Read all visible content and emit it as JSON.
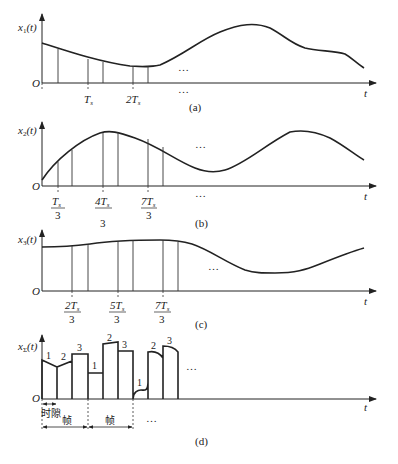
{
  "figure": {
    "panels": [
      {
        "id": "a",
        "caption": "(a)",
        "ylabel": "x1(t)",
        "ylabel_main": "x",
        "ylabel_sub": "1",
        "ylabel_arg": "(t)",
        "xlabel": "t",
        "origin": "O",
        "ticks": [
          {
            "label": "T",
            "sub": "s"
          },
          {
            "label": "2T",
            "sub": "s"
          }
        ],
        "ellipsis_upper": "…",
        "ellipsis_lower": "…"
      },
      {
        "id": "b",
        "caption": "(b)",
        "ylabel_main": "x",
        "ylabel_sub": "2",
        "ylabel_arg": "(t)",
        "xlabel": "t",
        "origin": "O",
        "ticks": [
          {
            "num": "T",
            "sub": "s",
            "den": "3"
          },
          {
            "num": "4T",
            "sub": "s",
            "den": "3"
          },
          {
            "num": "7T",
            "sub": "s",
            "den": "3"
          }
        ],
        "ellipsis_upper": "…",
        "ellipsis_lower": "…"
      },
      {
        "id": "c",
        "caption": "(c)",
        "ylabel_main": "x",
        "ylabel_sub": "3",
        "ylabel_arg": "(t)",
        "xlabel": "t",
        "origin": "O",
        "ticks": [
          {
            "num": "2T",
            "sub": "s",
            "den": "3"
          },
          {
            "num": "5T",
            "sub": "s",
            "den": "3"
          },
          {
            "num": "7T",
            "sub": "s",
            "den": "3"
          }
        ],
        "ellipsis_upper": "…"
      },
      {
        "id": "d",
        "caption": "(d)",
        "ylabel_main": "x",
        "ylabel_sub": "Σ",
        "ylabel_arg": "(t)",
        "xlabel": "t",
        "origin": "O",
        "slot_numbers": [
          "1",
          "2",
          "3",
          "1",
          "2",
          "3",
          "1",
          "2",
          "3"
        ],
        "time_slot_label": "时隙",
        "frame_labels": [
          "帧",
          "帧"
        ],
        "ellipsis_upper": "…",
        "ellipsis_lower": "…"
      }
    ]
  }
}
